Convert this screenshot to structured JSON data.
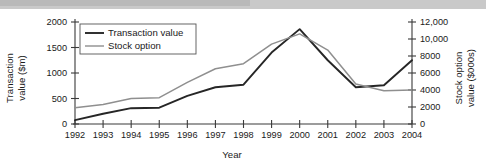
{
  "chart_data": {
    "type": "line",
    "title": "",
    "xlabel": "Year",
    "ylabel": "Transaction value ($m)",
    "ylabel_right": "Stock option value ($000s)",
    "grid": false,
    "legend_position": "top-left-inside",
    "categories": [
      "1992",
      "1993",
      "1994",
      "1995",
      "1996",
      "1997",
      "1998",
      "1999",
      "2000",
      "2001",
      "2002",
      "2003",
      "2004"
    ],
    "x": [
      1992,
      1993,
      1994,
      1995,
      1996,
      1997,
      1998,
      1999,
      2000,
      2001,
      2002,
      2003,
      2004
    ],
    "xlim": [
      1992,
      2004
    ],
    "ylim": [
      0,
      2000
    ],
    "ylim_right": [
      0,
      12000
    ],
    "yticks": [
      0,
      500,
      1000,
      1500,
      2000
    ],
    "ytick_labels": [
      "0",
      "500",
      "1000",
      "1500",
      "2000"
    ],
    "yticks_right": [
      0,
      2000,
      4000,
      6000,
      8000,
      10000,
      12000
    ],
    "ytick_labels_right": [
      "0",
      "2000",
      "4000",
      "6000",
      "8000",
      "10,000",
      "12,000"
    ],
    "series": [
      {
        "name": "Transaction value",
        "axis": "left",
        "color": "#262626",
        "values": [
          75,
          200,
          310,
          320,
          550,
          720,
          770,
          1400,
          1860,
          1250,
          720,
          760,
          1250
        ]
      },
      {
        "name": "Stock option",
        "axis": "right",
        "color": "#8f8f8f",
        "values": [
          1900,
          2300,
          3000,
          3100,
          4900,
          6500,
          7100,
          9400,
          10600,
          8700,
          4700,
          3900,
          4000
        ]
      }
    ]
  },
  "legend": {
    "entries": [
      {
        "label": "Transaction value"
      },
      {
        "label": "Stock option"
      }
    ]
  },
  "axes": {
    "left_title_line1": "Transaction",
    "left_title_line2": "value ($m)",
    "right_title_line1": "Stock option",
    "right_title_line2": "value ($000s)",
    "x_title": "Year"
  }
}
